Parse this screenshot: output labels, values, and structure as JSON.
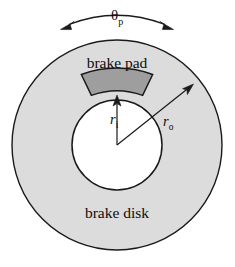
{
  "figure": {
    "name": "brake disk and brake pad geometry diagram",
    "labels": {
      "brake_pad": "brake pad",
      "brake_disk": "brake disk",
      "theta_symbol": "θ",
      "theta_subscript": "p",
      "inner_radius_symbol": "r",
      "inner_radius_subscript": "i",
      "outer_radius_symbol": "r",
      "outer_radius_subscript": "o"
    },
    "colors": {
      "background": "#ffffff",
      "disk_fill": "#dcdcdc",
      "pad_fill": "#9e9e9e",
      "hub_fill": "#ffffff",
      "outline": "#1a1a1a",
      "text": "#0d0d0d"
    },
    "geometry": {
      "center_x": 117,
      "center_y": 145,
      "outer_radius": 105,
      "inner_radius": 45,
      "pad_inner_radius": 75,
      "pad_half_angle_deg": 20,
      "theta_arc_radius": 118
    }
  }
}
